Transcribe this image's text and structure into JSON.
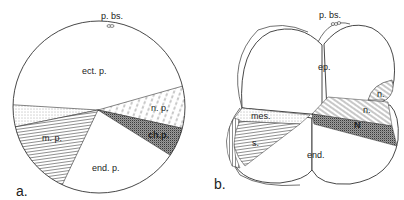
{
  "panel_a": {
    "panel_label": "a.",
    "labels": {
      "pbs": "p. bs.",
      "ect": "ect. p.",
      "np": "n. p.",
      "chp": "ch.p.",
      "mp": "m. p.",
      "endp": "end. p."
    }
  },
  "panel_b": {
    "panel_label": "b.",
    "labels": {
      "pbs": "p. bs.",
      "ep": "ep.",
      "n_small": "n.",
      "n": "n.",
      "N": "N",
      "mes": "mes.",
      "s": "s.",
      "end": "end."
    }
  },
  "colors": {
    "line": "#333333",
    "background": "#ffffff",
    "stipple_dark": "#555555"
  }
}
